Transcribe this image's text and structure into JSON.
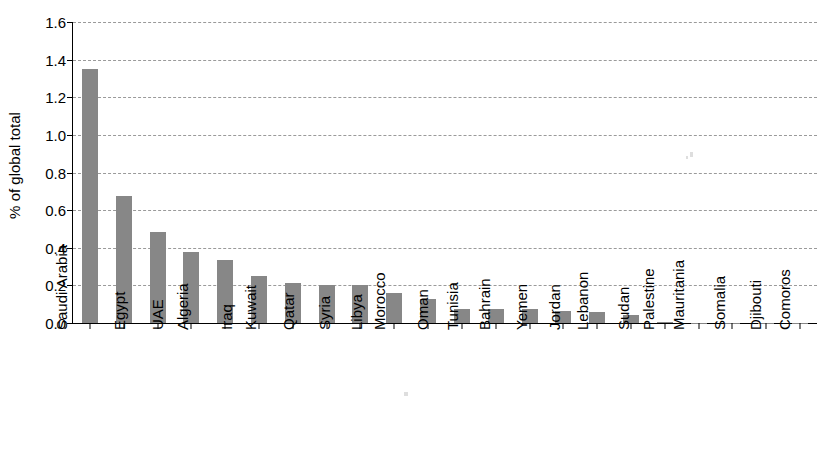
{
  "chart_data": {
    "type": "bar",
    "title": "",
    "xlabel": "",
    "ylabel": "% of global total",
    "ylim": [
      0.0,
      1.6
    ],
    "ytick_step": 0.2,
    "grid": true,
    "legend": false,
    "bar_color": "#878787",
    "categories": [
      "Saudi Arabia",
      "Egypt",
      "UAE",
      "Algeria",
      "Iraq",
      "Kuwait",
      "Qatar",
      "Syria",
      "Libya",
      "Morocco",
      "Oman",
      "Tunisia",
      "Bahrain",
      "Yemen",
      "Jordan",
      "Lebanon",
      "Sudan",
      "Palestine",
      "Mauritania",
      "Somalia",
      "Djibouti",
      "Comoros"
    ],
    "values": [
      1.35,
      0.675,
      0.485,
      0.375,
      0.335,
      0.25,
      0.215,
      0.2,
      0.2,
      0.16,
      0.13,
      0.075,
      0.072,
      0.072,
      0.065,
      0.06,
      0.04,
      0.003,
      0.002,
      0.002,
      0.001,
      0.001
    ],
    "ytick_labels": [
      "0.0",
      "0.2",
      "0.4",
      "0.6",
      "0.8",
      "1.0",
      "1.2",
      "1.4",
      "1.6"
    ],
    "ytick_values": [
      0.0,
      0.2,
      0.4,
      0.6,
      0.8,
      1.0,
      1.2,
      1.4,
      1.6
    ]
  }
}
